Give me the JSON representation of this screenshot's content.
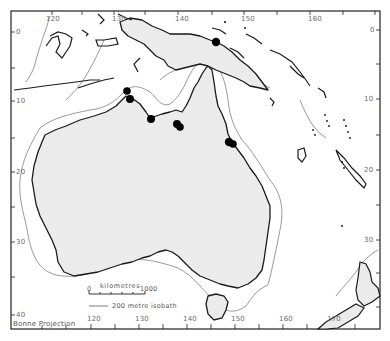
{
  "map": {
    "projection_label": "Bonne Projection",
    "region": "Australia, New Guinea, Melanesia and New Zealand",
    "colors": {
      "land_fill": "#ebebeb",
      "coastline": "#1a1a1a",
      "isobath": "#555555",
      "site_marker": "#000000",
      "frame": "#222222",
      "background": "#ffffff"
    },
    "longitude_ticks_top": [
      "120",
      "130",
      "140",
      "150",
      "160"
    ],
    "longitude_ticks_bottom": [
      "120",
      "130",
      "140",
      "150",
      "160",
      "170"
    ],
    "latitude_ticks_left": [
      "0",
      "10",
      "20",
      "30",
      "40"
    ],
    "latitude_ticks_right": [
      "0",
      "10",
      "20",
      "30"
    ],
    "legend": {
      "scale_title": "kilometres",
      "scale_start": "0",
      "scale_end": "1000",
      "isobath_label": "200 metre isobath"
    },
    "site_markers": [
      {
        "id": "new-guinea-north",
        "x": 216,
        "y": 42
      },
      {
        "id": "kimberley-1",
        "x": 127,
        "y": 91
      },
      {
        "id": "kimberley-2",
        "x": 130,
        "y": 99
      },
      {
        "id": "arnhem-west",
        "x": 151,
        "y": 119
      },
      {
        "id": "gulf-carpentaria-1",
        "x": 177,
        "y": 124
      },
      {
        "id": "gulf-carpentaria-2",
        "x": 180,
        "y": 127
      },
      {
        "id": "queensland-coast-1",
        "x": 229,
        "y": 142
      },
      {
        "id": "queensland-coast-2",
        "x": 233,
        "y": 144
      }
    ]
  }
}
